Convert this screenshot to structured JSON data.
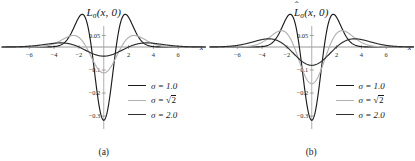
{
  "figure": {
    "background": "#ffffff",
    "panels": [
      {
        "id": "a",
        "subcaption": "(a)",
        "title_base": "L",
        "title_sub": "σ",
        "title_args": "(x, 0)",
        "title_has_hat": false,
        "title_full": "Lσ(x,0)"
      },
      {
        "id": "b",
        "subcaption": "(b)",
        "title_base": "L",
        "title_sub": "σ",
        "title_args": "(x, 0)",
        "title_has_hat": true,
        "title_full": "L̂σ(x,0)"
      }
    ]
  },
  "legend": {
    "position": "center-right",
    "entries": [
      {
        "label_prefix": "σ = ",
        "label_value": "1.0",
        "is_radical": false,
        "color": "#1c1c1c"
      },
      {
        "label_prefix": "σ = ",
        "label_value": "2",
        "is_radical": true,
        "color": "#b0b0b0"
      },
      {
        "label_prefix": "σ = ",
        "label_value": "2.0",
        "is_radical": false,
        "color": "#2e2e2e"
      }
    ]
  },
  "axes": {
    "xlabel": "x",
    "xticks": [
      -6,
      -4,
      -2,
      2,
      4,
      6
    ],
    "xtick_labels": [
      "-6",
      "-4",
      "-2",
      "2",
      "4",
      "6"
    ],
    "yticks": [
      0.05,
      -0.1,
      -0.2,
      -0.3
    ],
    "ytick_labels": [
      "0.05",
      "-0.1",
      "-0.2",
      "-0.3"
    ],
    "xlim": [
      -8.2,
      8.2
    ],
    "ylim": [
      -0.33,
      0.075
    ],
    "grid": false
  },
  "chart_data": [
    {
      "type": "line",
      "title": "Lσ(x,0)",
      "subcaption": "(a)",
      "xlabel": "x",
      "ylabel": "",
      "xlim": [
        -8.2,
        8.2
      ],
      "ylim": [
        -0.33,
        0.075
      ],
      "xticks": [
        -6,
        -4,
        -2,
        2,
        4,
        6
      ],
      "yticks": [
        0.05,
        -0.1,
        -0.2,
        -0.3
      ],
      "grid": false,
      "legend_position": "center-right",
      "series": [
        {
          "name": "σ = 1.0",
          "color": "#1c1c1c",
          "form": "laplacian-of-gaussian",
          "sigma": 1.0,
          "amplitude": -0.3183,
          "center_value": -0.3183,
          "lobe_peak_value": 0.0431,
          "lobe_peak_x": 1.732,
          "zero_crossing_x": 1.0
        },
        {
          "name": "σ = √2",
          "color": "#b0b0b0",
          "form": "laplacian-of-gaussian",
          "sigma": 1.4142,
          "amplitude": -0.1125,
          "center_value": -0.1125,
          "lobe_peak_value": 0.0152,
          "lobe_peak_x": 2.449,
          "zero_crossing_x": 1.4142
        },
        {
          "name": "σ = 2.0",
          "color": "#2e2e2e",
          "form": "laplacian-of-gaussian",
          "sigma": 2.0,
          "amplitude": -0.0398,
          "center_value": -0.0398,
          "lobe_peak_value": 0.0054,
          "lobe_peak_x": 3.464,
          "zero_crossing_x": 2.0
        }
      ]
    },
    {
      "type": "line",
      "title": "L̂σ(x,0)",
      "subcaption": "(b)",
      "xlabel": "x",
      "ylabel": "",
      "xlim": [
        -8.2,
        8.2
      ],
      "ylim": [
        -0.33,
        0.075
      ],
      "xticks": [
        -6,
        -4,
        -2,
        2,
        4,
        6
      ],
      "yticks": [
        0.05,
        -0.1,
        -0.2,
        -0.3
      ],
      "grid": false,
      "legend_position": "center-right",
      "series": [
        {
          "name": "σ = 1.0",
          "color": "#1c1c1c",
          "form": "scale-normalized-laplacian-of-gaussian",
          "sigma": 1.0,
          "amplitude": -0.3183,
          "center_value": -0.3183,
          "lobe_peak_value": 0.0431,
          "lobe_peak_x": 1.732,
          "zero_crossing_x": 1.0
        },
        {
          "name": "σ = √2",
          "color": "#b0b0b0",
          "form": "scale-normalized-laplacian-of-gaussian",
          "sigma": 1.4142,
          "amplitude": -0.1591,
          "center_value": -0.1591,
          "lobe_peak_value": 0.0215,
          "lobe_peak_x": 2.449,
          "zero_crossing_x": 1.4142
        },
        {
          "name": "σ = 2.0",
          "color": "#2e2e2e",
          "form": "scale-normalized-laplacian-of-gaussian",
          "sigma": 2.0,
          "amplitude": -0.0796,
          "center_value": -0.0796,
          "lobe_peak_value": 0.0108,
          "lobe_peak_x": 3.464,
          "zero_crossing_x": 2.0
        }
      ]
    }
  ]
}
